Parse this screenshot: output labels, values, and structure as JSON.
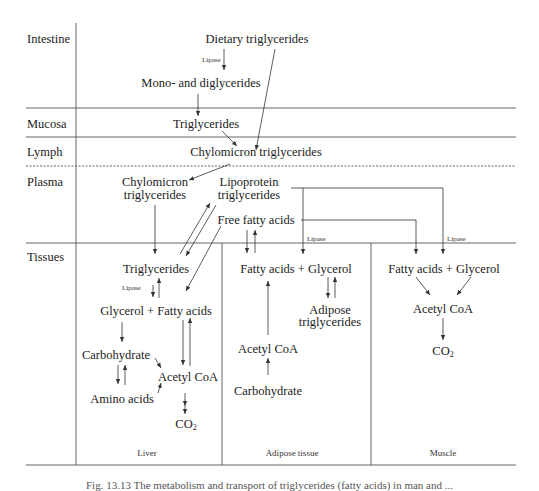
{
  "rows": {
    "intestine": "Intestine",
    "mucosa": "Mucosa",
    "lymph": "Lymph",
    "plasma": "Plasma",
    "tissues": "Tissues"
  },
  "intestine": {
    "dietary_tg": "Dietary triglycerides",
    "lipase": "Lipase",
    "mono_di": "Mono- and diglycerides"
  },
  "mucosa": {
    "tg": "Triglycerides"
  },
  "lymph": {
    "chylo_tg": "Chylomicron triglycerides"
  },
  "plasma": {
    "chylo_l1": "Chylomicron",
    "chylo_l2": "triglycerides",
    "lipo_l1": "Lipoprotein",
    "lipo_l2": "triglycerides",
    "ffa": "Free fatty acids",
    "lipase_adipose": "Lipase",
    "lipase_muscle": "Lipase"
  },
  "liver": {
    "tg": "Triglycerides",
    "lipase": "Lipase",
    "glycerol_fa": "Glycerol + Fatty acids",
    "carbohydrate": "Carbohydrate",
    "acetyl_coa": "Acetyl CoA",
    "amino_acids": "Amino acids",
    "co2_base": "CO",
    "co2_sub": "2",
    "title": "Liver"
  },
  "adipose": {
    "fa_glycerol": "Fatty acids + Glycerol",
    "adipose_l1": "Adipose",
    "adipose_l2": "triglycerides",
    "acetyl_coa": "Acetyl CoA",
    "carbohydrate": "Carbohydrate",
    "title": "Adipose tissue"
  },
  "muscle": {
    "fa_glycerol": "Fatty acids + Glycerol",
    "acetyl_coa": "Acetyl CoA",
    "co2_base": "CO",
    "co2_sub": "2",
    "title": "Muscle"
  },
  "caption": "Fig. 13.13  The metabolism and transport of triglycerides (fatty acids) in man and ...",
  "colors": {
    "line": "#444444",
    "text": "#222222",
    "background": "#ffffff"
  }
}
